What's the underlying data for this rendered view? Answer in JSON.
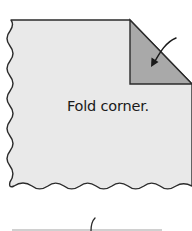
{
  "diagram": {
    "caption": "Fold corner.",
    "colors": {
      "paper_fill": "#e9e9e9",
      "fold_fill": "#a9a9a9",
      "outline": "#2b2b2b",
      "background": "#ffffff",
      "next_step_line": "#d0d0d0"
    },
    "elements": {
      "paper_sheet": "paper-with-torn-left-and-bottom-edges",
      "folded_corner": "triangle-top-right",
      "fold_arrow": "curved-arrow-down-left-icon",
      "next_step_preview": "partial-curved-stroke"
    }
  }
}
